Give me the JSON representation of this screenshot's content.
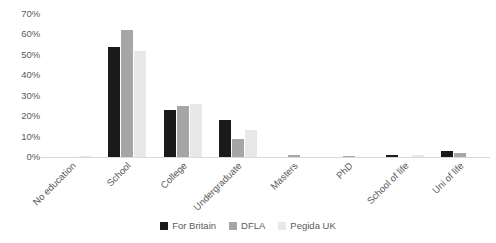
{
  "chart_data": {
    "type": "bar",
    "title": "",
    "xlabel": "",
    "ylabel": "",
    "ylim": [
      0,
      70
    ],
    "ytick_labels": [
      "70%",
      "60%",
      "50%",
      "40%",
      "30%",
      "20%",
      "10%",
      "0%"
    ],
    "ytick_values": [
      70,
      60,
      50,
      40,
      30,
      20,
      10,
      0
    ],
    "grid": false,
    "legend_position": "bottom",
    "categories": [
      "No education",
      "School",
      "College",
      "Undergraduate",
      "Masters",
      "PhD",
      "School of life",
      "Uni of life"
    ],
    "series": [
      {
        "name": "For Britain",
        "color": "#1a1a1a",
        "values": [
          0,
          54,
          23,
          18,
          0,
          0,
          1,
          3
        ]
      },
      {
        "name": "DFLA",
        "color": "#a6a6a6",
        "values": [
          0,
          62,
          25,
          9,
          1,
          0.5,
          0,
          2
        ]
      },
      {
        "name": "Pegida UK",
        "color": "#e8e8e8",
        "values": [
          0.5,
          52,
          26,
          13,
          0,
          0,
          1,
          0
        ]
      }
    ]
  }
}
